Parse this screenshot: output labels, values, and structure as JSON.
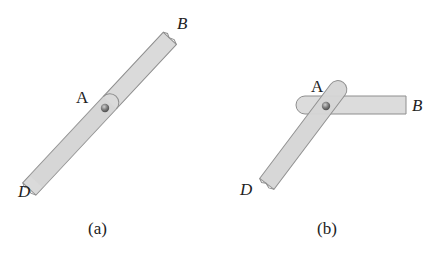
{
  "figure": {
    "panel_a": {
      "caption": "(a)",
      "labels": {
        "A": "A",
        "B": "B",
        "D": "D"
      },
      "description": "single straight bar DB with pin at A, bars aligned"
    },
    "panel_b": {
      "caption": "(b)",
      "labels": {
        "A": "A",
        "B": "B",
        "D": "D"
      },
      "description": "bar AD rotated about pin A relative to horizontal bar AB"
    },
    "colors": {
      "bar_fill": "#d9d9d9",
      "bar_stroke": "#8c8c8c",
      "pin": "#7a7a7a",
      "text": "#222222"
    }
  }
}
